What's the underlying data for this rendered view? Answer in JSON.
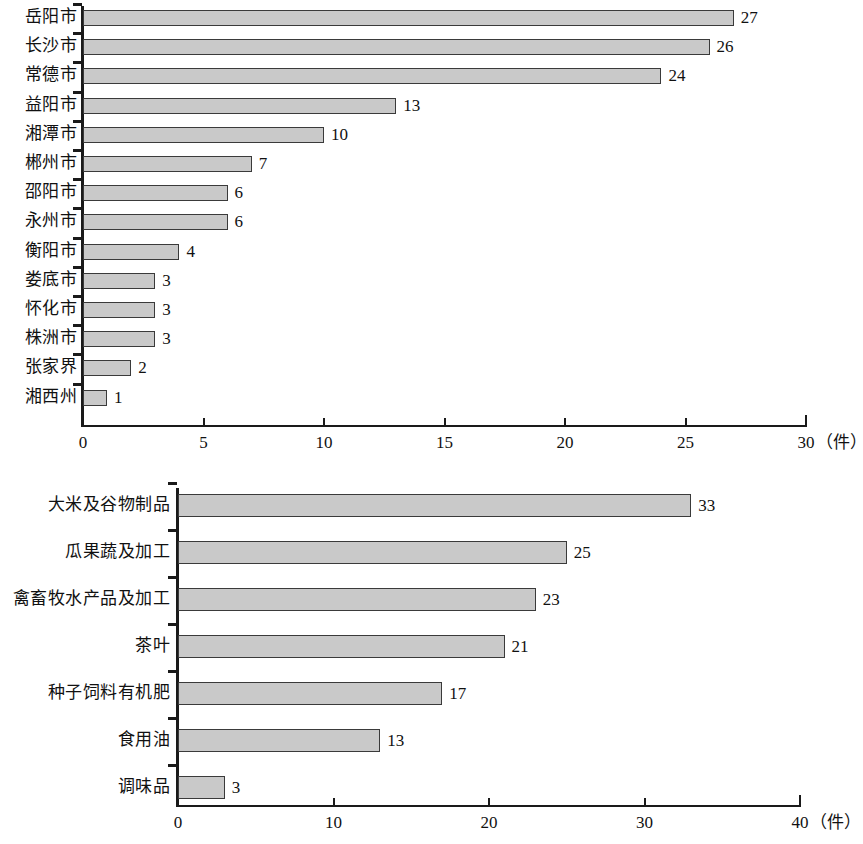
{
  "chart_data": [
    {
      "type": "bar",
      "orientation": "horizontal",
      "title": "",
      "xlabel": "（件）",
      "ylabel": "",
      "xlim": [
        0,
        30
      ],
      "xticks": [
        0,
        5,
        10,
        15,
        20,
        25,
        30
      ],
      "xticklabels": [
        "0",
        "5",
        "10",
        "15",
        "20",
        "25",
        "30"
      ],
      "grid": false,
      "legend": false,
      "bar_color": "#c9c9c9",
      "bar_edge_color": "#3a3a3a",
      "categories": [
        "岳阳市",
        "长沙市",
        "常德市",
        "益阳市",
        "湘潭市",
        "郴州市",
        "邵阳市",
        "永州市",
        "衡阳市",
        "娄底市",
        "怀化市",
        "株洲市",
        "张家界",
        "湘西州"
      ],
      "values": [
        27,
        26,
        24,
        13,
        10,
        7,
        6,
        6,
        4,
        3,
        3,
        3,
        2,
        1
      ],
      "datalabels": [
        "27",
        "26",
        "24",
        "13",
        "10",
        "7",
        "6",
        "6",
        "4",
        "3",
        "3",
        "3",
        "2",
        "1"
      ]
    },
    {
      "type": "bar",
      "orientation": "horizontal",
      "title": "",
      "xlabel": "（件）",
      "ylabel": "",
      "xlim": [
        0,
        40
      ],
      "xticks": [
        0,
        10,
        20,
        30,
        40
      ],
      "xticklabels": [
        "0",
        "10",
        "20",
        "30",
        "40"
      ],
      "grid": false,
      "legend": false,
      "bar_color": "#c9c9c9",
      "bar_edge_color": "#3a3a3a",
      "categories": [
        "大米及谷物制品",
        "瓜果蔬及加工",
        "禽畜牧水产品及加工",
        "茶叶",
        "种子饲料有机肥",
        "食用油",
        "调味品"
      ],
      "values": [
        33,
        25,
        23,
        21,
        17,
        13,
        3
      ],
      "datalabels": [
        "33",
        "25",
        "23",
        "21",
        "17",
        "13",
        "3"
      ]
    }
  ]
}
